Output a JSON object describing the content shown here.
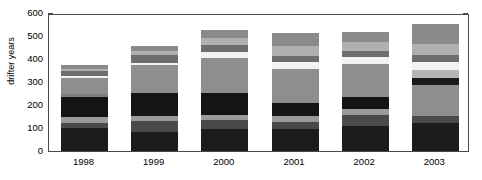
{
  "chart_data": {
    "type": "bar",
    "subtype": "stacked-bar",
    "title": "",
    "xlabel": "",
    "ylabel": "drifter years",
    "ylim": [
      0,
      600
    ],
    "yticks": [
      0,
      100,
      200,
      300,
      400,
      500,
      600
    ],
    "grid": false,
    "legend": "none",
    "categories": [
      "1998",
      "1999",
      "2000",
      "2001",
      "2002",
      "2003"
    ],
    "totals": [
      372,
      458,
      528,
      512,
      519,
      554
    ],
    "series": [
      {
        "name": "segment-1",
        "color": "#1c1c1c",
        "values": [
          100,
          82,
          96,
          96,
          108,
          122
        ]
      },
      {
        "name": "segment-2",
        "color": "#4a4a4a",
        "values": [
          22,
          47,
          40,
          30,
          48,
          30
        ]
      },
      {
        "name": "segment-3",
        "color": "#9a9a9a",
        "values": [
          26,
          22,
          22,
          28,
          26,
          0
        ]
      },
      {
        "name": "segment-4",
        "color": "#141414",
        "values": [
          85,
          100,
          95,
          56,
          52,
          0
        ]
      },
      {
        "name": "segment-5",
        "color": "#7d7d7d",
        "values": [
          14,
          0,
          0,
          0,
          0,
          0
        ]
      },
      {
        "name": "segment-6",
        "color": "#8e8e8e",
        "values": [
          70,
          121,
          152,
          148,
          144,
          134
        ]
      },
      {
        "name": "segment-7",
        "color": "#1a1a1a",
        "values": [
          0,
          0,
          0,
          0,
          0,
          32
        ]
      },
      {
        "name": "segment-8",
        "color": "#b5b5b5",
        "values": [
          0,
          0,
          0,
          0,
          0,
          34
        ]
      },
      {
        "name": "segment-9",
        "color": "#f2f2f2",
        "values": [
          9,
          12,
          24,
          28,
          30,
          36
        ]
      },
      {
        "name": "segment-10",
        "color": "#6e6e6e",
        "values": [
          22,
          33,
          30,
          27,
          27,
          28
        ]
      },
      {
        "name": "segment-11",
        "color": "#b0b0b0",
        "values": [
          10,
          20,
          34,
          42,
          40,
          50
        ]
      },
      {
        "name": "segment-12",
        "color": "#8a8a8a",
        "values": [
          14,
          21,
          35,
          57,
          44,
          88
        ]
      }
    ]
  },
  "axes": {
    "ylabel": "drifter years",
    "ytick_labels": [
      "0",
      "100",
      "200",
      "300",
      "400",
      "500",
      "600"
    ],
    "xtick_labels": [
      "1998",
      "1999",
      "2000",
      "2001",
      "2002",
      "2003"
    ]
  }
}
